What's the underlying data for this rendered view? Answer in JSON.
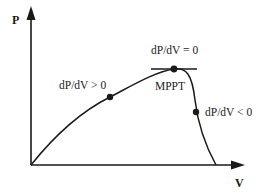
{
  "diagram": {
    "axes": {
      "y_label": "P",
      "x_label": "V"
    },
    "annotations": {
      "left_slope": "dP/dV > 0",
      "peak_slope": "dP/dV = 0",
      "peak_label": "MPPT",
      "right_slope": "dP/dV < 0"
    },
    "colors": {
      "line": "#1a1a1a",
      "background": "#ffffff"
    }
  }
}
